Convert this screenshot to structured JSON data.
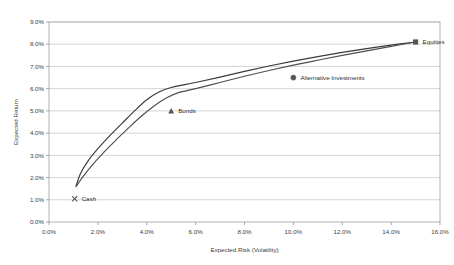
{
  "chart_data": {
    "type": "line",
    "title": "",
    "xlabel": "Expected Risk (Volatility)",
    "ylabel": "Expected Return",
    "xlim": [
      0,
      16
    ],
    "ylim": [
      0,
      9
    ],
    "xticks": [
      "0.0%",
      "2.0%",
      "4.0%",
      "6.0%",
      "8.0%",
      "10.0%",
      "12.0%",
      "14.0%",
      "16.0%"
    ],
    "xtick_values": [
      0,
      2,
      4,
      6,
      8,
      10,
      12,
      14,
      16
    ],
    "yticks": [
      "0.0%",
      "1.0%",
      "2.0%",
      "3.0%",
      "4.0%",
      "5.0%",
      "6.0%",
      "7.0%",
      "8.0%",
      "9.0%"
    ],
    "ytick_values": [
      0,
      1,
      2,
      3,
      4,
      5,
      6,
      7,
      8,
      9
    ],
    "grid": "horizontal",
    "legend": "none",
    "series": [
      {
        "name": "Efficient Frontier (upper)",
        "marker": "none",
        "color": "#3a3a3a",
        "points": [
          {
            "x": 1.1,
            "y": 1.6
          },
          {
            "x": 1.3,
            "y": 2.2
          },
          {
            "x": 1.6,
            "y": 2.75
          },
          {
            "x": 2.0,
            "y": 3.3
          },
          {
            "x": 2.5,
            "y": 3.9
          },
          {
            "x": 3.0,
            "y": 4.45
          },
          {
            "x": 3.5,
            "y": 5.0
          },
          {
            "x": 4.0,
            "y": 5.5
          },
          {
            "x": 4.5,
            "y": 5.85
          },
          {
            "x": 5.0,
            "y": 6.05
          },
          {
            "x": 6.0,
            "y": 6.28
          },
          {
            "x": 7.0,
            "y": 6.52
          },
          {
            "x": 8.0,
            "y": 6.78
          },
          {
            "x": 9.0,
            "y": 7.02
          },
          {
            "x": 10.0,
            "y": 7.24
          },
          {
            "x": 11.0,
            "y": 7.44
          },
          {
            "x": 12.0,
            "y": 7.63
          },
          {
            "x": 13.0,
            "y": 7.8
          },
          {
            "x": 14.0,
            "y": 7.96
          },
          {
            "x": 15.0,
            "y": 8.1
          }
        ]
      },
      {
        "name": "Efficient Frontier (lower)",
        "marker": "none",
        "color": "#4e4e4e",
        "points": [
          {
            "x": 1.1,
            "y": 1.58
          },
          {
            "x": 1.4,
            "y": 2.05
          },
          {
            "x": 1.8,
            "y": 2.6
          },
          {
            "x": 2.3,
            "y": 3.2
          },
          {
            "x": 2.8,
            "y": 3.75
          },
          {
            "x": 3.3,
            "y": 4.28
          },
          {
            "x": 3.8,
            "y": 4.78
          },
          {
            "x": 4.3,
            "y": 5.22
          },
          {
            "x": 4.8,
            "y": 5.58
          },
          {
            "x": 5.3,
            "y": 5.82
          },
          {
            "x": 6.0,
            "y": 6.0
          },
          {
            "x": 7.0,
            "y": 6.28
          },
          {
            "x": 8.0,
            "y": 6.56
          },
          {
            "x": 9.0,
            "y": 6.82
          },
          {
            "x": 10.0,
            "y": 7.06
          },
          {
            "x": 11.0,
            "y": 7.28
          },
          {
            "x": 12.0,
            "y": 7.5
          },
          {
            "x": 13.0,
            "y": 7.7
          },
          {
            "x": 14.0,
            "y": 7.9
          },
          {
            "x": 15.0,
            "y": 8.1
          }
        ]
      }
    ],
    "asset_points": [
      {
        "label": "Cash",
        "x": 1.05,
        "y": 1.05,
        "marker": "cross",
        "label_dx": 7,
        "label_dy": 2.2
      },
      {
        "label": "Bonds",
        "x": 5.0,
        "y": 5.0,
        "marker": "triangle",
        "label_dx": 7,
        "label_dy": 2.2
      },
      {
        "label": "Alternative Investments",
        "x": 10.0,
        "y": 6.5,
        "marker": "circle",
        "label_dx": 7,
        "label_dy": 2.2
      },
      {
        "label": "Equities",
        "x": 15.0,
        "y": 8.1,
        "marker": "square",
        "label_dx": 7,
        "label_dy": 2.2
      }
    ]
  }
}
